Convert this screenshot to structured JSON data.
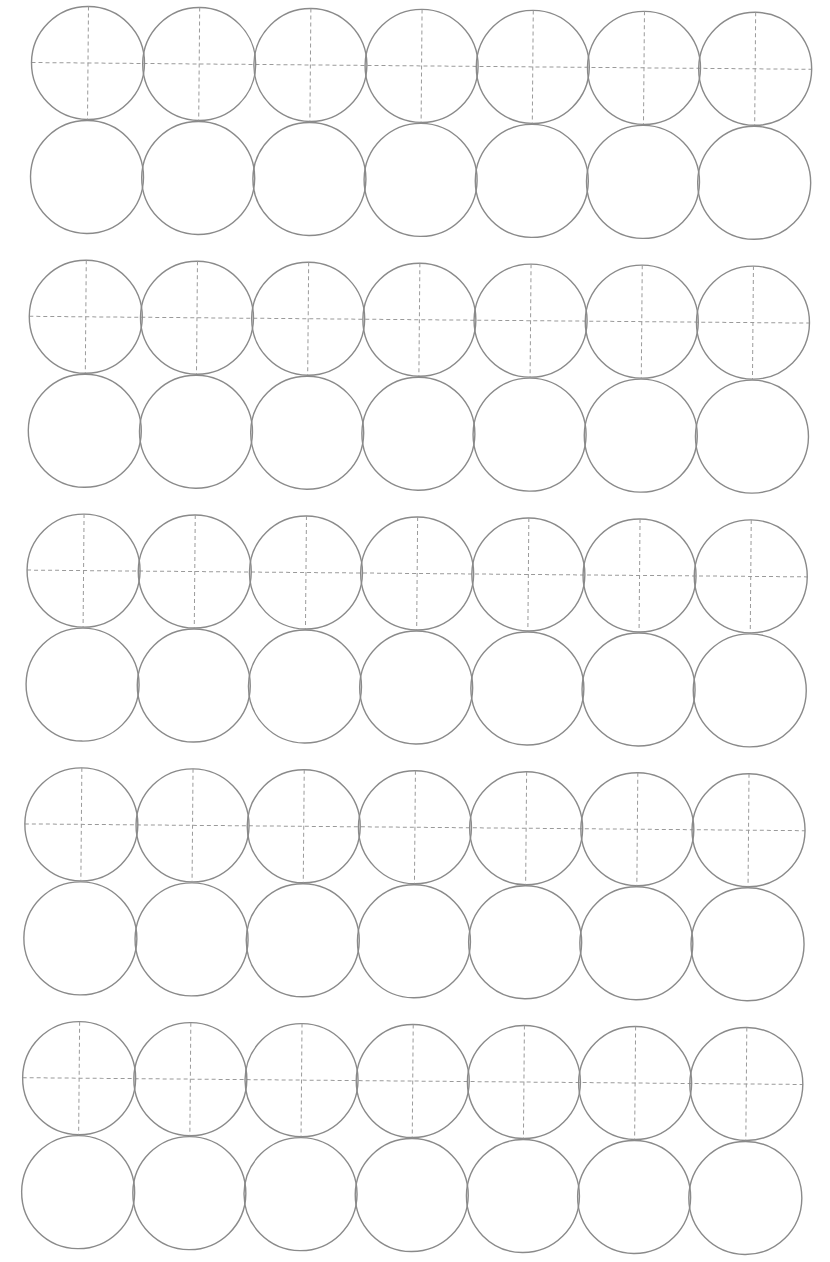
{
  "sheet": {
    "title": "Circle template sheet",
    "groups": 5,
    "columns": 7,
    "rows_per_group": 2,
    "upper_row_style": "dashed-crosshair",
    "lower_row_style": "plain",
    "colors": {
      "circle_stroke": "#8a8a8a",
      "guide_stroke": "#9a9a9a",
      "background": "#ffffff"
    },
    "geometry": {
      "origin_x": 88,
      "origin_y": 63,
      "radius": 56.5,
      "column_pitch": 111.2,
      "row_pitch": 114,
      "group_pitch": 253.8,
      "rotation_deg": 0.5
    }
  }
}
